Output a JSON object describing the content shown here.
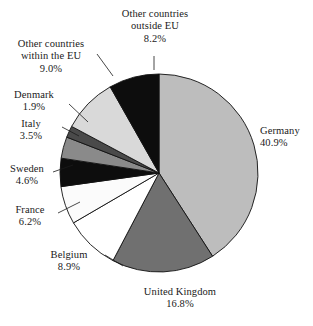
{
  "chart_data": {
    "type": "pie",
    "title": "",
    "subtitle": "",
    "xlabel": "",
    "ylabel": "",
    "legend_position": "none",
    "grid": false,
    "units": "percent",
    "start_angle_deg": 0,
    "direction": "clockwise",
    "categories": [
      "Germany",
      "United Kingdom",
      "Belgium",
      "France",
      "Sweden",
      "Italy",
      "Denmark",
      "Other countries within the EU",
      "Other countries outside EU"
    ],
    "values": [
      40.9,
      16.8,
      8.9,
      6.2,
      4.6,
      3.5,
      1.9,
      9.0,
      8.2
    ],
    "value_labels": [
      "40.9%",
      "16.8%",
      "8.9%",
      "6.2%",
      "4.6%",
      "3.5%",
      "1.9%",
      "9.0%",
      "8.2%"
    ],
    "colors": [
      "#bdbdbd",
      "#707070",
      "#ffffff",
      "#fbfbfb",
      "#0d0d0d",
      "#8a8a8a",
      "#4a4a4a",
      "#d9d9d9",
      "#0d0d0d"
    ],
    "stroke_color": "#111111",
    "slices": [
      {
        "label": "Germany",
        "value": 40.9,
        "value_label": "40.9%",
        "color": "#bdbdbd"
      },
      {
        "label": "United Kingdom",
        "value": 16.8,
        "value_label": "16.8%",
        "color": "#707070"
      },
      {
        "label": "Belgium",
        "value": 8.9,
        "value_label": "8.9%",
        "color": "#ffffff"
      },
      {
        "label": "France",
        "value": 6.2,
        "value_label": "6.2%",
        "color": "#fbfbfb"
      },
      {
        "label": "Sweden",
        "value": 4.6,
        "value_label": "4.6%",
        "color": "#0d0d0d"
      },
      {
        "label": "Italy",
        "value": 3.5,
        "value_label": "3.5%",
        "color": "#8a8a8a"
      },
      {
        "label": "Denmark",
        "value": 1.9,
        "value_label": "1.9%",
        "color": "#4a4a4a"
      },
      {
        "label": "Other countries within the EU",
        "value": 9.0,
        "value_label": "9.0%",
        "color": "#d9d9d9"
      },
      {
        "label": "Other countries outside EU",
        "value": 8.2,
        "value_label": "8.2%",
        "color": "#0d0d0d"
      }
    ]
  },
  "labels": {
    "outside_eu": {
      "line1": "Other countries",
      "line2": "outside EU",
      "value": "8.2%"
    },
    "within_eu": {
      "line1": "Other countries",
      "line2": "within the EU",
      "value": "9.0%"
    },
    "denmark": {
      "name": "Denmark",
      "value": "1.9%"
    },
    "italy": {
      "name": "Italy",
      "value": "3.5%"
    },
    "sweden": {
      "name": "Sweden",
      "value": "4.6%"
    },
    "france": {
      "name": "France",
      "value": "6.2%"
    },
    "belgium": {
      "name": "Belgium",
      "value": "8.9%"
    },
    "united_kingdom": {
      "name": "United Kingdom",
      "value": "16.8%"
    },
    "germany": {
      "name": "Germany",
      "value": "40.9%"
    }
  }
}
